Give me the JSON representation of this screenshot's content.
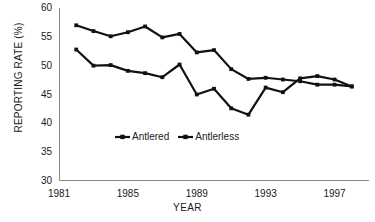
{
  "chart_data": {
    "type": "line",
    "title": "",
    "xlabel": "YEAR",
    "ylabel": "REPORTING RATE (%)",
    "xlim": [
      1981,
      1999
    ],
    "ylim": [
      30,
      60
    ],
    "xticks": [
      1981,
      1985,
      1989,
      1993,
      1997
    ],
    "xtick_labels": [
      "1981",
      "1985",
      "1989",
      "1993",
      "1997"
    ],
    "yticks": [
      30,
      35,
      40,
      45,
      50,
      55,
      60
    ],
    "ytick_labels": [
      "30",
      "35",
      "40",
      "45",
      "50",
      "55",
      "60"
    ],
    "grid": false,
    "legend_position": "inside lower center",
    "x": [
      1982,
      1983,
      1984,
      1985,
      1986,
      1987,
      1988,
      1989,
      1990,
      1991,
      1992,
      1993,
      1994,
      1995,
      1996,
      1997,
      1998
    ],
    "series": [
      {
        "name": "Antlered",
        "marker": "square",
        "color": "#111111",
        "values": [
          57.0,
          56.0,
          55.1,
          55.8,
          56.8,
          54.9,
          55.5,
          52.3,
          52.7,
          49.4,
          47.7,
          47.9,
          47.6,
          47.3,
          46.7,
          46.7,
          46.4
        ]
      },
      {
        "name": "Antlerless",
        "marker": "square",
        "color": "#111111",
        "values": [
          52.8,
          50.0,
          50.1,
          49.1,
          48.7,
          48.0,
          50.2,
          45.0,
          46.0,
          42.6,
          41.5,
          46.2,
          45.4,
          47.8,
          48.2,
          47.6,
          46.4
        ]
      }
    ]
  },
  "legend": {
    "items": [
      {
        "label": "Antlered"
      },
      {
        "label": "Antlerless"
      }
    ]
  },
  "axes": {
    "y_title": "REPORTING RATE (%)",
    "x_title": "YEAR"
  }
}
